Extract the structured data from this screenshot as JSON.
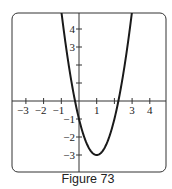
{
  "chart_data": {
    "type": "line",
    "title": "",
    "caption": "Figure 73",
    "xlabel": "",
    "ylabel": "",
    "xlim": [
      -3.8,
      4.9
    ],
    "ylim": [
      -3.9,
      4.9
    ],
    "grid": false,
    "x_ticks": [
      -3,
      -2,
      -1,
      1,
      2,
      3,
      4
    ],
    "x_tick_labels": [
      "−3",
      "−2",
      "−1",
      "1",
      "",
      "3",
      "4"
    ],
    "y_ticks": [
      -3,
      -2,
      -1,
      1,
      2,
      3,
      4
    ],
    "y_tick_labels": [
      "−3",
      "−2",
      "−1",
      "",
      "",
      "3",
      "4"
    ],
    "series": [
      {
        "name": "parabola",
        "equation": "y = 2(x - 1)^2 - 3",
        "vertex": [
          1,
          -3
        ],
        "y_intercept": -1,
        "x_intercepts": [
          -0.22,
          2.22
        ],
        "x": [
          -1.0,
          -0.5,
          0,
          0.5,
          1,
          1.5,
          2,
          2.5,
          3.0
        ],
        "y": [
          5,
          1.5,
          -1,
          -2.5,
          -3,
          -2.5,
          -1,
          1.5,
          5
        ],
        "color": "#1a1a1a"
      }
    ]
  }
}
